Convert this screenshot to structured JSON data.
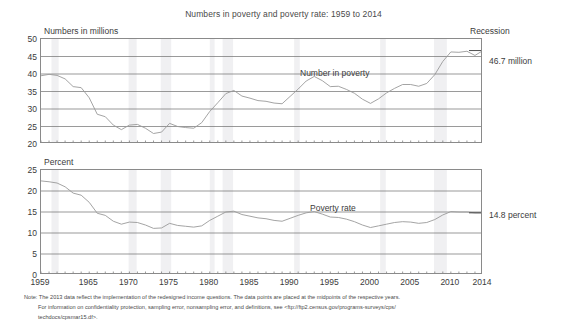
{
  "title": "Numbers in poverty and poverty rate: 1959 to 2014",
  "recession_legend": "Recession",
  "panels": {
    "top": {
      "axis_title": "Numbers in millions",
      "series_label": "Number in poverty",
      "endpoint_label": "46.7 million",
      "yticks": [
        "50",
        "45",
        "40",
        "35",
        "30",
        "25",
        "20"
      ]
    },
    "bottom": {
      "axis_title": "Percent",
      "series_label": "Poverty rate",
      "endpoint_label": "14.8 percent",
      "yticks": [
        "25",
        "20",
        "15",
        "10",
        "5",
        "0"
      ]
    }
  },
  "xticks": [
    "1959",
    "1965",
    "1970",
    "1975",
    "1980",
    "1985",
    "1990",
    "1995",
    "2000",
    "2005",
    "2010",
    "2014"
  ],
  "note": {
    "line1": "Note: The 2013 data reflect the implementation of the redesigned income questions. The data points are placed at the midpoints of the respective years.",
    "line2": "For information on confidentiality protection, sampling error, nonsampling error, and definitions, see <ftp://ftp2.census.gov/programs-surveys/cps/",
    "line3": "techdocs/cpsmar15.df>."
  },
  "colors": {
    "line": "#9a9a9a",
    "grid": "#6e6e6e",
    "frame": "#8a8a8a",
    "recession_band": "#f0f0f2",
    "text": "#3b3b3b"
  },
  "chart_data": [
    {
      "type": "line",
      "title": "Number in poverty",
      "xlabel": "",
      "ylabel": "Numbers in millions",
      "ylim": [
        20,
        50
      ],
      "xlim": [
        1959,
        2014
      ],
      "grid": true,
      "x": [
        1959,
        1960,
        1961,
        1962,
        1963,
        1964,
        1965,
        1966,
        1967,
        1968,
        1969,
        1970,
        1971,
        1972,
        1973,
        1974,
        1975,
        1976,
        1977,
        1978,
        1979,
        1980,
        1981,
        1982,
        1983,
        1984,
        1985,
        1986,
        1987,
        1988,
        1989,
        1990,
        1991,
        1992,
        1993,
        1994,
        1995,
        1996,
        1997,
        1998,
        1999,
        2000,
        2001,
        2002,
        2003,
        2004,
        2005,
        2006,
        2007,
        2008,
        2009,
        2010,
        2011,
        2012,
        2013,
        2014
      ],
      "values": [
        39.5,
        39.9,
        39.6,
        38.6,
        36.4,
        36.1,
        33.2,
        28.5,
        27.8,
        25.4,
        24.1,
        25.4,
        25.6,
        24.5,
        23.0,
        23.4,
        25.9,
        25.0,
        24.7,
        24.5,
        26.1,
        29.3,
        31.8,
        34.4,
        35.3,
        33.7,
        33.1,
        32.4,
        32.2,
        31.7,
        31.5,
        33.6,
        35.7,
        38.0,
        39.3,
        38.1,
        36.4,
        36.5,
        35.6,
        34.5,
        32.8,
        31.6,
        32.9,
        34.6,
        35.9,
        37.0,
        37.0,
        36.5,
        37.3,
        39.8,
        43.6,
        46.3,
        46.2,
        46.5,
        45.3,
        46.7
      ],
      "annotations": [
        {
          "text": "46.7 million",
          "x": 2014,
          "y": 46.7
        }
      ]
    },
    {
      "type": "line",
      "title": "Poverty rate",
      "xlabel": "",
      "ylabel": "Percent",
      "ylim": [
        0,
        25
      ],
      "xlim": [
        1959,
        2014
      ],
      "grid": true,
      "x": [
        1959,
        1960,
        1961,
        1962,
        1963,
        1964,
        1965,
        1966,
        1967,
        1968,
        1969,
        1970,
        1971,
        1972,
        1973,
        1974,
        1975,
        1976,
        1977,
        1978,
        1979,
        1980,
        1981,
        1982,
        1983,
        1984,
        1985,
        1986,
        1987,
        1988,
        1989,
        1990,
        1991,
        1992,
        1993,
        1994,
        1995,
        1996,
        1997,
        1998,
        1999,
        2000,
        2001,
        2002,
        2003,
        2004,
        2005,
        2006,
        2007,
        2008,
        2009,
        2010,
        2011,
        2012,
        2013,
        2014
      ],
      "values": [
        22.4,
        22.2,
        21.9,
        21.0,
        19.5,
        19.0,
        17.3,
        14.7,
        14.2,
        12.8,
        12.1,
        12.6,
        12.5,
        11.9,
        11.1,
        11.2,
        12.3,
        11.8,
        11.6,
        11.4,
        11.7,
        13.0,
        14.0,
        15.0,
        15.2,
        14.4,
        14.0,
        13.6,
        13.4,
        13.0,
        12.8,
        13.5,
        14.2,
        14.8,
        15.1,
        14.5,
        13.8,
        13.7,
        13.3,
        12.7,
        11.9,
        11.3,
        11.7,
        12.1,
        12.5,
        12.7,
        12.6,
        12.3,
        12.5,
        13.2,
        14.3,
        15.1,
        15.0,
        15.0,
        14.8,
        14.8
      ],
      "annotations": [
        {
          "text": "14.8 percent",
          "x": 2014,
          "y": 14.8
        }
      ]
    }
  ],
  "recession_bands": [
    {
      "start": 1960.3,
      "end": 1961.2
    },
    {
      "start": 1969.9,
      "end": 1970.9
    },
    {
      "start": 1973.9,
      "end": 1975.2
    },
    {
      "start": 1980.0,
      "end": 1980.6
    },
    {
      "start": 1981.6,
      "end": 1982.9
    },
    {
      "start": 1990.5,
      "end": 1991.2
    },
    {
      "start": 2001.2,
      "end": 2001.9
    },
    {
      "start": 2007.9,
      "end": 2009.5
    }
  ]
}
